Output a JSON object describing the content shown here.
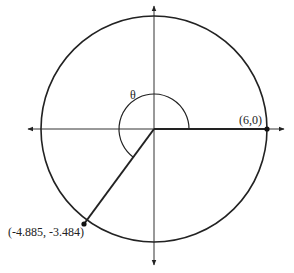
{
  "diagram": {
    "type": "unit-circle-angle",
    "colors": {
      "stroke": "#222222",
      "background": "#ffffff"
    },
    "circle": {
      "radius_units": 6
    },
    "angle_label": "θ",
    "points": [
      {
        "id": "initial",
        "label": "(6,0)",
        "x": 6,
        "y": 0
      },
      {
        "id": "terminal",
        "label": "(-4.885, -3.484)",
        "x": -4.885,
        "y": -3.484
      }
    ],
    "axes": {
      "x_arrows": true,
      "y_arrows": true
    }
  }
}
